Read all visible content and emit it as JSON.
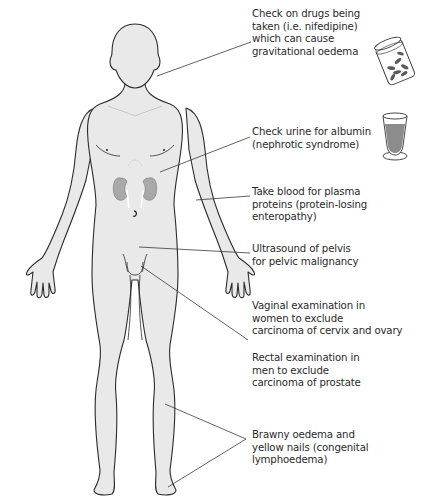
{
  "colors": {
    "body_fill": "#e9e9e9",
    "outline": "#2b2b2b",
    "leader_line": "#3a3a3a",
    "kidney_fill": "#a9a9a9",
    "urine_fill": "#8c8c8c",
    "text": "#2a2a2a"
  },
  "annotations": [
    {
      "id": "drugs",
      "lines": [
        "Check on drugs being",
        "taken (i.e. nifedipine)",
        "which can cause",
        "gravitational oedema"
      ],
      "target": "neck",
      "icon": "pill-bottle-icon"
    },
    {
      "id": "urine",
      "lines": [
        "Check urine for albumin",
        "(nephrotic syndrome)"
      ],
      "target": "kidneys",
      "icon": "urine-glass-icon"
    },
    {
      "id": "blood",
      "lines": [
        "Take blood for plasma",
        "proteins (protein-losing",
        "enteropathy)"
      ],
      "target": "arm"
    },
    {
      "id": "ultrasound",
      "lines": [
        "Ultrasound of pelvis",
        "for pelvic malignancy"
      ],
      "target": "pelvis"
    },
    {
      "id": "vaginal",
      "lines": [
        "Vaginal examination in",
        "women to exclude",
        "carcinoma of cervix and ovary"
      ],
      "target": "groin"
    },
    {
      "id": "rectal",
      "lines": [
        "Rectal examination in",
        "men to exclude",
        "carcinoma of prostate"
      ],
      "target": "none"
    },
    {
      "id": "brawny",
      "lines": [
        "Brawny oedema and",
        "yellow nails (congenital",
        "lymphoedema)"
      ],
      "target": "leg-and-toes"
    }
  ]
}
